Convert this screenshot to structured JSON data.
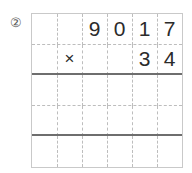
{
  "problem": {
    "marker": "②",
    "marker_icon": "circled-numeral-two"
  },
  "grid": {
    "columns": 6,
    "rows": [
      {
        "name": "multiplicand-row",
        "separator": "dashed",
        "cells": [
          "",
          "",
          "9",
          "0",
          "1",
          "7"
        ]
      },
      {
        "name": "multiplier-row",
        "separator": "solid",
        "cells": [
          "",
          "×",
          "",
          "",
          "3",
          "4"
        ]
      },
      {
        "name": "partial-product-row-1",
        "separator": "dashed",
        "cells": [
          "",
          "",
          "",
          "",
          "",
          ""
        ]
      },
      {
        "name": "partial-product-row-2",
        "separator": "solid",
        "cells": [
          "",
          "",
          "",
          "",
          "",
          ""
        ]
      },
      {
        "name": "total-row",
        "separator": "none",
        "cells": [
          "",
          "",
          "",
          "",
          "",
          ""
        ]
      }
    ]
  },
  "chart_data": {
    "type": "table",
    "title": "",
    "operation": "multiply",
    "operator_symbol": "×",
    "multiplicand": "9017",
    "multiplier": "34",
    "answer": "",
    "columns": 6,
    "rows": 5,
    "cells": [
      [
        "",
        "",
        "9",
        "0",
        "1",
        "7"
      ],
      [
        "",
        "×",
        "",
        "",
        "3",
        "4"
      ],
      [
        "",
        "",
        "",
        "",
        "",
        ""
      ],
      [
        "",
        "",
        "",
        "",
        "",
        ""
      ],
      [
        "",
        "",
        "",
        "",
        "",
        ""
      ]
    ],
    "row_separators": [
      "dashed",
      "solid",
      "dashed",
      "solid",
      "none"
    ],
    "colors": {
      "background": "#ffffff",
      "border": "#c9c9c9",
      "guide_line": "#bdbdbd",
      "rule_line": "#6e6e6e",
      "digit": "#2b2b2b",
      "marker": "#5a5a5a"
    }
  }
}
